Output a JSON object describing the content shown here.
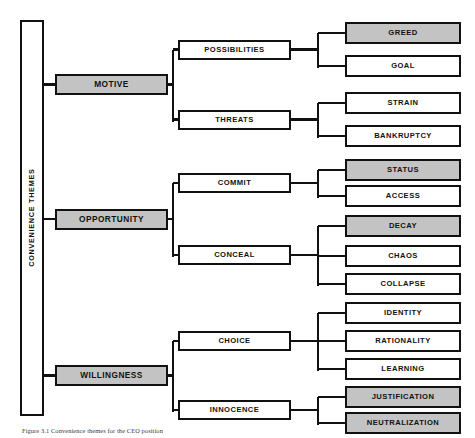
{
  "figure": {
    "root_label": "CONVENIENCE THEMES",
    "caption": "Figure 3.1 Convenience themes for the CEO position",
    "colors": {
      "highlight_fill": "#c3c3c3",
      "plain_fill": "#ffffff",
      "stroke": "#111111",
      "text": "#111111"
    },
    "legend_note": "Shaded boxes indicate highlighted themes"
  },
  "themes": [
    {
      "id": "motive",
      "label": "MOTIVE",
      "highlighted": true,
      "categories": [
        {
          "id": "possibilities",
          "label": "POSSIBILITIES",
          "highlighted": false,
          "leaves": [
            {
              "id": "greed",
              "label": "GREED",
              "highlighted": true
            },
            {
              "id": "goal",
              "label": "GOAL",
              "highlighted": false
            }
          ]
        },
        {
          "id": "threats",
          "label": "THREATS",
          "highlighted": false,
          "leaves": [
            {
              "id": "strain",
              "label": "STRAIN",
              "highlighted": false
            },
            {
              "id": "bankruptcy",
              "label": "BANKRUPTCY",
              "highlighted": false
            }
          ]
        }
      ]
    },
    {
      "id": "opportunity",
      "label": "OPPORTUNITY",
      "highlighted": true,
      "categories": [
        {
          "id": "commit",
          "label": "COMMIT",
          "highlighted": false,
          "leaves": [
            {
              "id": "status",
              "label": "STATUS",
              "highlighted": true
            },
            {
              "id": "access",
              "label": "ACCESS",
              "highlighted": false
            }
          ]
        },
        {
          "id": "conceal",
          "label": "CONCEAL",
          "highlighted": false,
          "leaves": [
            {
              "id": "decay",
              "label": "DECAY",
              "highlighted": true
            },
            {
              "id": "chaos",
              "label": "CHAOS",
              "highlighted": false
            },
            {
              "id": "collapse",
              "label": "COLLAPSE",
              "highlighted": false
            }
          ]
        }
      ]
    },
    {
      "id": "willingness",
      "label": "WILLINGNESS",
      "highlighted": true,
      "categories": [
        {
          "id": "choice",
          "label": "CHOICE",
          "highlighted": false,
          "leaves": [
            {
              "id": "identity",
              "label": "IDENTITY",
              "highlighted": false
            },
            {
              "id": "rationality",
              "label": "RATIONALITY",
              "highlighted": false
            },
            {
              "id": "learning",
              "label": "LEARNING",
              "highlighted": false
            }
          ]
        },
        {
          "id": "innocence",
          "label": "INNOCENCE",
          "highlighted": false,
          "leaves": [
            {
              "id": "justification",
              "label": "JUSTIFICATION",
              "highlighted": true
            },
            {
              "id": "neutralization",
              "label": "NEUTRALIZATION",
              "highlighted": true
            }
          ]
        }
      ]
    }
  ]
}
